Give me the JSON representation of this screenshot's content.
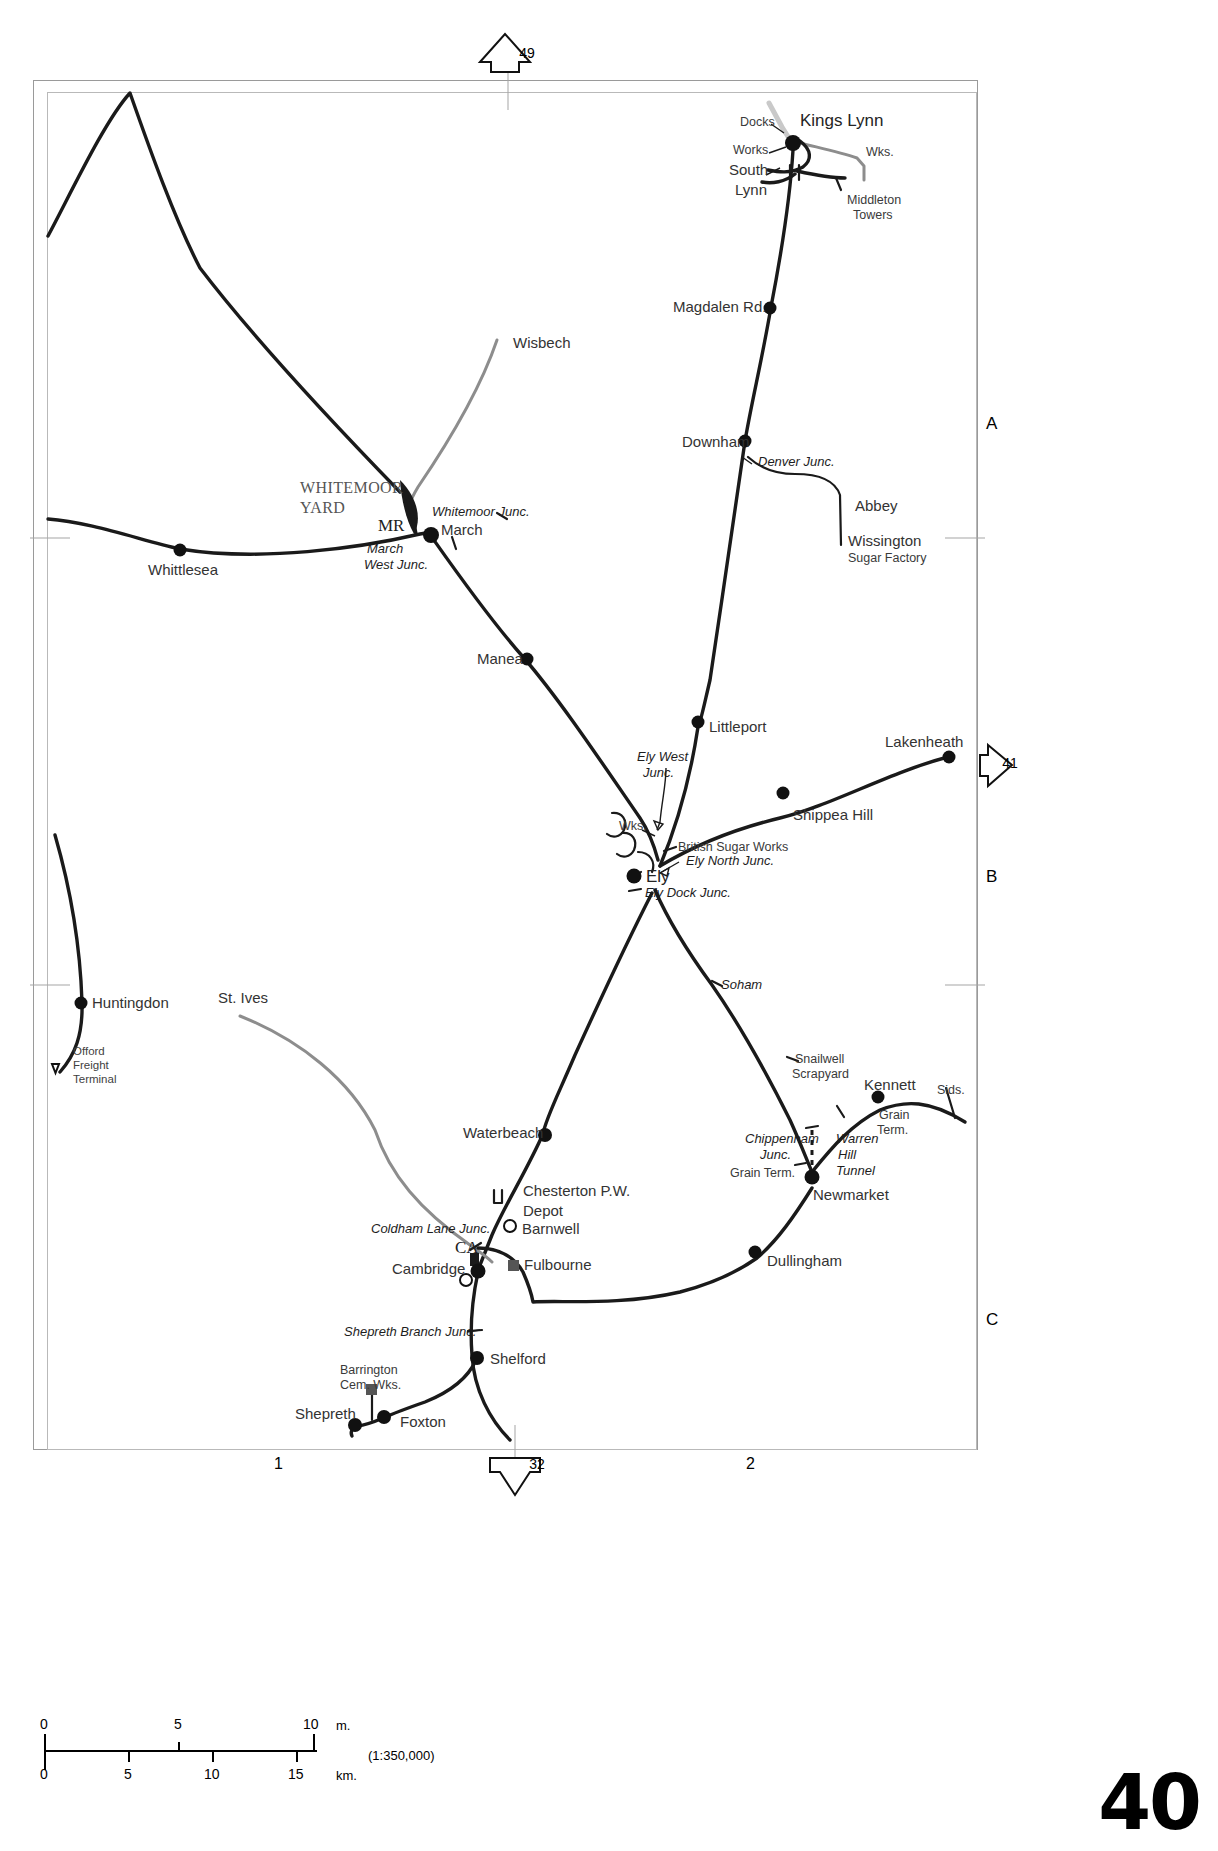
{
  "page": {
    "number": "40",
    "scale_ratio": "(1:350,000)"
  },
  "grid": {
    "rows": [
      "A",
      "B",
      "C"
    ],
    "columns": [
      "1",
      "2"
    ]
  },
  "connectors": [
    {
      "name": "top",
      "number": "49",
      "direction": "up"
    },
    {
      "name": "right",
      "number": "41",
      "direction": "right"
    },
    {
      "name": "bottom",
      "number": "32",
      "direction": "down"
    }
  ],
  "scale_bar": {
    "miles": {
      "ticks": [
        "0",
        "5",
        "10"
      ],
      "unit": "m."
    },
    "km": {
      "ticks": [
        "0",
        "5",
        "10",
        "15"
      ],
      "unit": "km."
    }
  },
  "map": {
    "title_region": "East Anglia / Fenland railway network",
    "stations": [
      {
        "name": "Kings Lynn",
        "x": 800,
        "y": 120,
        "style": "major"
      },
      {
        "name": "Docks",
        "x": 740,
        "y": 123,
        "style": "small"
      },
      {
        "name": "Works",
        "x": 733,
        "y": 151,
        "style": "small"
      },
      {
        "name": "South",
        "x": 729,
        "y": 171,
        "style": "medium"
      },
      {
        "name": "Lynn",
        "x": 735,
        "y": 191,
        "style": "medium"
      },
      {
        "name": "Wks.",
        "x": 866,
        "y": 153,
        "style": "small"
      },
      {
        "name": "Middleton",
        "x": 847,
        "y": 200,
        "style": "small"
      },
      {
        "name": "Towers",
        "x": 853,
        "y": 215,
        "style": "small"
      },
      {
        "name": "Magdalen Rd.",
        "x": 673,
        "y": 307,
        "style": "medium"
      },
      {
        "name": "Downham",
        "x": 682,
        "y": 442,
        "style": "medium"
      },
      {
        "name": "Denver Junc.",
        "x": 758,
        "y": 463,
        "style": "junc"
      },
      {
        "name": "Abbey",
        "x": 855,
        "y": 506,
        "style": "medium"
      },
      {
        "name": "Wissington",
        "x": 848,
        "y": 541,
        "style": "medium"
      },
      {
        "name": "Sugar Factory",
        "x": 848,
        "y": 558,
        "style": "small"
      },
      {
        "name": "Wisbech",
        "x": 513,
        "y": 343,
        "style": "medium"
      },
      {
        "name": "WHITEMOOR",
        "x": 300,
        "y": 489,
        "style": "yard"
      },
      {
        "name": "YARD",
        "x": 300,
        "y": 508,
        "style": "yard"
      },
      {
        "name": "MR",
        "x": 380,
        "y": 527,
        "style": "serif-b"
      },
      {
        "name": "Whitemoor Junc.",
        "x": 432,
        "y": 513,
        "style": "junc"
      },
      {
        "name": "March",
        "x": 441,
        "y": 530,
        "style": "medium"
      },
      {
        "name": "March",
        "x": 367,
        "y": 549,
        "style": "junc"
      },
      {
        "name": "West Junc.",
        "x": 364,
        "y": 565,
        "style": "junc"
      },
      {
        "name": "Whittlesea",
        "x": 148,
        "y": 569,
        "style": "medium"
      },
      {
        "name": "Manea",
        "x": 477,
        "y": 659,
        "style": "medium"
      },
      {
        "name": "Littleport",
        "x": 709,
        "y": 727,
        "style": "medium"
      },
      {
        "name": "Lakenheath",
        "x": 885,
        "y": 742,
        "style": "medium"
      },
      {
        "name": "Ely West",
        "x": 637,
        "y": 758,
        "style": "junc"
      },
      {
        "name": "Junc.",
        "x": 643,
        "y": 774,
        "style": "junc"
      },
      {
        "name": "Shippea Hill",
        "x": 793,
        "y": 814,
        "style": "medium"
      },
      {
        "name": "Wks.",
        "x": 619,
        "y": 826,
        "style": "small"
      },
      {
        "name": "British Sugar Works",
        "x": 678,
        "y": 847,
        "style": "small"
      },
      {
        "name": "Ely North Junc.",
        "x": 686,
        "y": 861,
        "style": "junc"
      },
      {
        "name": "Ely",
        "x": 646,
        "y": 876,
        "style": "major"
      },
      {
        "name": "Ely Dock Junc.",
        "x": 645,
        "y": 894,
        "style": "junc"
      },
      {
        "name": "Soham",
        "x": 721,
        "y": 986,
        "style": "junc"
      },
      {
        "name": "Huntingdon",
        "x": 92,
        "y": 1003,
        "style": "medium"
      },
      {
        "name": "Offord",
        "x": 73,
        "y": 1052,
        "style": "tiny"
      },
      {
        "name": "Freight",
        "x": 73,
        "y": 1066,
        "style": "tiny"
      },
      {
        "name": "Terminal",
        "x": 73,
        "y": 1080,
        "style": "tiny"
      },
      {
        "name": "St. Ives",
        "x": 218,
        "y": 998,
        "style": "medium"
      },
      {
        "name": "Snailwell",
        "x": 795,
        "y": 1059,
        "style": "small"
      },
      {
        "name": "Scrapyard",
        "x": 792,
        "y": 1074,
        "style": "small"
      },
      {
        "name": "Kennett",
        "x": 864,
        "y": 1085,
        "style": "medium"
      },
      {
        "name": "Sids.",
        "x": 937,
        "y": 1090,
        "style": "small"
      },
      {
        "name": "Grain",
        "x": 879,
        "y": 1115,
        "style": "small"
      },
      {
        "name": "Term.",
        "x": 877,
        "y": 1130,
        "style": "small"
      },
      {
        "name": "Waterbeach",
        "x": 463,
        "y": 1133,
        "style": "medium"
      },
      {
        "name": "Chippenham",
        "x": 745,
        "y": 1140,
        "style": "junc"
      },
      {
        "name": "Junc.",
        "x": 760,
        "y": 1155,
        "style": "junc"
      },
      {
        "name": "Warren",
        "x": 836,
        "y": 1140,
        "style": "junc"
      },
      {
        "name": "Hill",
        "x": 838,
        "y": 1155,
        "style": "junc"
      },
      {
        "name": "Tunnel",
        "x": 836,
        "y": 1170,
        "style": "junc"
      },
      {
        "name": "Grain Term.",
        "x": 730,
        "y": 1173,
        "style": "small"
      },
      {
        "name": "Newmarket",
        "x": 813,
        "y": 1195,
        "style": "medium"
      },
      {
        "name": "Chesterton P.W.",
        "x": 523,
        "y": 1191,
        "style": "medium"
      },
      {
        "name": "Depot",
        "x": 523,
        "y": 1211,
        "style": "medium"
      },
      {
        "name": "Coldham Lane Junc.",
        "x": 371,
        "y": 1230,
        "style": "junc"
      },
      {
        "name": "Barnwell",
        "x": 522,
        "y": 1229,
        "style": "medium"
      },
      {
        "name": "CA",
        "x": 457,
        "y": 1247,
        "style": "serif-b"
      },
      {
        "name": "Fulbourne",
        "x": 524,
        "y": 1265,
        "style": "medium"
      },
      {
        "name": "Cambridge",
        "x": 392,
        "y": 1269,
        "style": "medium"
      },
      {
        "name": "Dullingham",
        "x": 767,
        "y": 1261,
        "style": "medium"
      },
      {
        "name": "Shepreth Branch Junc.",
        "x": 344,
        "y": 1333,
        "style": "junc"
      },
      {
        "name": "Barrington",
        "x": 340,
        "y": 1370,
        "style": "small"
      },
      {
        "name": "Cem. Wks.",
        "x": 340,
        "y": 1385,
        "style": "small"
      },
      {
        "name": "Shelford",
        "x": 490,
        "y": 1359,
        "style": "medium"
      },
      {
        "name": "Shepreth",
        "x": 295,
        "y": 1414,
        "style": "medium"
      },
      {
        "name": "Foxton",
        "x": 400,
        "y": 1422,
        "style": "medium"
      }
    ]
  }
}
